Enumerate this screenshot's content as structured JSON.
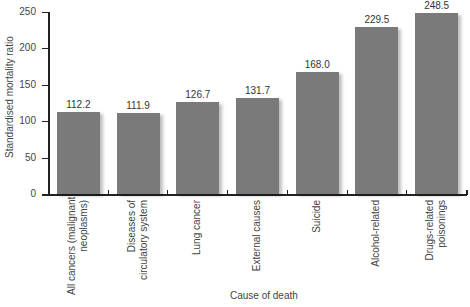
{
  "chart_data": {
    "type": "bar",
    "title": "",
    "xlabel": "Cause of death",
    "ylabel": "Standardised mortality ratio",
    "ylim": [
      0,
      250
    ],
    "yticks": [
      0,
      50,
      100,
      150,
      200,
      250
    ],
    "grid": false,
    "legend": null,
    "categories": [
      "All cancers (malignant\nneoplasms)",
      "Diseases of\ncirculatory system",
      "Lung cancer",
      "External causes",
      "Suicide",
      "Alcohol-related",
      "Drugs-related\npoisonings"
    ],
    "values": [
      112.2,
      111.9,
      126.7,
      131.7,
      168.0,
      229.5,
      248.5
    ],
    "value_labels": [
      "112.2",
      "111.9",
      "126.7",
      "131.7",
      "168.0",
      "229.5",
      "248.5"
    ],
    "bar_color": "#7a7a7a"
  }
}
